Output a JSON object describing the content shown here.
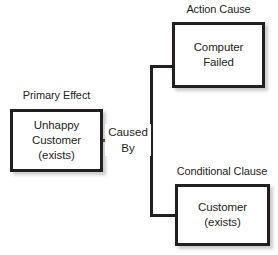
{
  "diagram": {
    "type": "cause-effect-chart",
    "background_color": "#ffffff",
    "border_color": "#231f20",
    "text_color": "#231f20",
    "nodes": [
      {
        "id": "primary-effect",
        "caption": "Primary Effect",
        "lines": [
          "Unhappy",
          "Customer",
          "(exists)"
        ]
      },
      {
        "id": "action-cause",
        "caption": "Action Cause",
        "lines": [
          "Computer",
          "Failed"
        ]
      },
      {
        "id": "conditional-clause",
        "caption": "Conditional Clause",
        "lines": [
          "Customer",
          "(exists)"
        ]
      }
    ],
    "edge_label": {
      "line1": "Caused",
      "line2": "By"
    }
  }
}
